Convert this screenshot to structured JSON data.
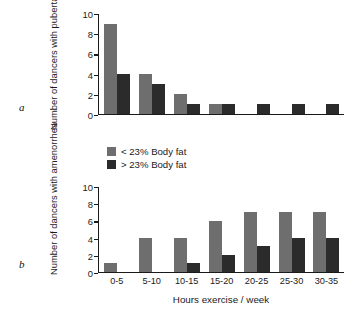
{
  "figure": {
    "panel_a_letter": "a",
    "panel_b_letter": "b"
  },
  "legend": {
    "items": [
      {
        "label": "< 23% Body fat",
        "color": "#6e6e6e",
        "key": "light"
      },
      {
        "label": "> 23% Body fat",
        "color": "#2b2b2b",
        "key": "dark"
      }
    ]
  },
  "axis": {
    "yticks": [
      "10",
      "8",
      "6",
      "4",
      "2",
      "0"
    ],
    "xlabel": "Hours exercise / week"
  },
  "chart_data": [
    {
      "type": "bar",
      "panel": "a",
      "title": "",
      "xlabel": "",
      "ylabel": "Number of dancers with pubertal progression",
      "categories": [
        "0-5",
        "5-10",
        "10-15",
        "15-20",
        "20-25",
        "25-30",
        "30-35"
      ],
      "ylim": [
        0,
        10
      ],
      "yticks": [
        0,
        2,
        4,
        6,
        8,
        10
      ],
      "grid": false,
      "legend_position": "below-panel-a",
      "series": [
        {
          "name": "< 23% Body fat",
          "color": "#6e6e6e",
          "values": [
            9,
            4,
            2,
            1,
            0,
            0,
            0
          ]
        },
        {
          "name": "> 23% Body fat",
          "color": "#2b2b2b",
          "values": [
            4,
            3,
            1,
            1,
            1,
            1,
            1
          ]
        }
      ]
    },
    {
      "type": "bar",
      "panel": "b",
      "title": "",
      "xlabel": "Hours exercise / week",
      "ylabel": "Number of dancers with amenorrhea",
      "categories": [
        "0-5",
        "5-10",
        "10-15",
        "15-20",
        "20-25",
        "25-30",
        "30-35"
      ],
      "ylim": [
        0,
        10
      ],
      "yticks": [
        0,
        2,
        4,
        6,
        8,
        10
      ],
      "grid": false,
      "series": [
        {
          "name": "< 23% Body fat",
          "color": "#6e6e6e",
          "values": [
            1,
            4,
            4,
            6,
            7,
            7,
            7
          ]
        },
        {
          "name": "> 23% Body fat",
          "color": "#2b2b2b",
          "values": [
            0,
            0,
            1,
            2,
            3,
            4,
            4
          ]
        }
      ]
    }
  ],
  "ylabels": {
    "panel_a": "Number of dancers with pubertal progression",
    "panel_b": "Number of dancers with amenorrhea"
  }
}
